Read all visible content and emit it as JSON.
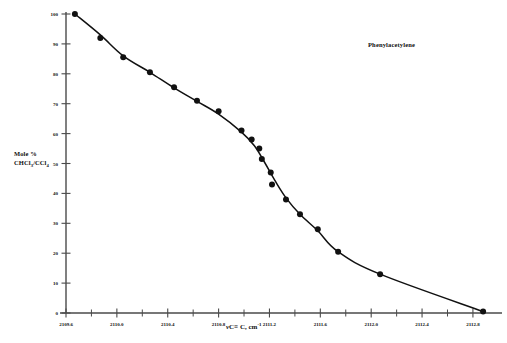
{
  "chart_data": {
    "type": "scatter",
    "title": "Phenylacetylene",
    "xlabel": "νC≡C, cm⁻¹",
    "ylabel": "Mole % CHCl3/CCl4",
    "ylabel_line1": "Mole %",
    "ylabel_line2_pre": "CHCl",
    "ylabel_line2_sub1": "3",
    "ylabel_line2_mid": "/CCl",
    "ylabel_line2_sub2": "4",
    "xlabel_nu": "ν",
    "xlabel_rest": "C≡ C, cm",
    "xlabel_sup": "-1",
    "xlim": [
      2109.6,
      2112.95
    ],
    "ylim": [
      0,
      100
    ],
    "grid": false,
    "legend": null,
    "x_tick_labels": [
      "2109.6",
      "2110.0",
      "2110.4",
      "2110.8",
      "2111.2",
      "2111.6",
      "2112.0",
      "2112.4",
      "2112.8"
    ],
    "x_tick_values": [
      2109.6,
      2110.0,
      2110.4,
      2110.8,
      2111.2,
      2111.6,
      2112.0,
      2112.4,
      2112.8
    ],
    "x_minor_tick_values": [
      2109.8,
      2110.2,
      2110.6,
      2111.0,
      2111.4,
      2111.8,
      2112.2,
      2112.6
    ],
    "y_tick_labels": [
      "0",
      "10",
      "20",
      "30",
      "40",
      "50",
      "60",
      "70",
      "80",
      "90",
      "100"
    ],
    "y_tick_values": [
      0,
      10,
      20,
      30,
      40,
      50,
      60,
      70,
      80,
      90,
      100
    ],
    "points": [
      {
        "x": 2109.67,
        "y": 100
      },
      {
        "x": 2109.87,
        "y": 92
      },
      {
        "x": 2110.05,
        "y": 85.5
      },
      {
        "x": 2110.26,
        "y": 80.5
      },
      {
        "x": 2110.45,
        "y": 75.5
      },
      {
        "x": 2110.63,
        "y": 71
      },
      {
        "x": 2110.8,
        "y": 67.5
      },
      {
        "x": 2110.98,
        "y": 61
      },
      {
        "x": 2111.06,
        "y": 58
      },
      {
        "x": 2111.12,
        "y": 55
      },
      {
        "x": 2111.14,
        "y": 51.5
      },
      {
        "x": 2111.21,
        "y": 47
      },
      {
        "x": 2111.22,
        "y": 43
      },
      {
        "x": 2111.33,
        "y": 38
      },
      {
        "x": 2111.44,
        "y": 33
      },
      {
        "x": 2111.58,
        "y": 28
      },
      {
        "x": 2111.74,
        "y": 20.5
      },
      {
        "x": 2112.07,
        "y": 13
      },
      {
        "x": 2112.88,
        "y": 0.5
      }
    ],
    "line_path": [
      {
        "x": 2109.67,
        "y": 100
      },
      {
        "x": 2109.87,
        "y": 93
      },
      {
        "x": 2110.05,
        "y": 86
      },
      {
        "x": 2110.26,
        "y": 80.5
      },
      {
        "x": 2110.45,
        "y": 75.3
      },
      {
        "x": 2110.63,
        "y": 70.8
      },
      {
        "x": 2110.8,
        "y": 66.5
      },
      {
        "x": 2110.98,
        "y": 60.5
      },
      {
        "x": 2111.08,
        "y": 56
      },
      {
        "x": 2111.16,
        "y": 50.5
      },
      {
        "x": 2111.24,
        "y": 44.5
      },
      {
        "x": 2111.33,
        "y": 38.5
      },
      {
        "x": 2111.44,
        "y": 33
      },
      {
        "x": 2111.58,
        "y": 27.5
      },
      {
        "x": 2111.74,
        "y": 20.5
      },
      {
        "x": 2112.07,
        "y": 13
      },
      {
        "x": 2112.88,
        "y": 0.5
      }
    ],
    "marker": "filled-circle",
    "marker_color": "#111111",
    "line_color": "#111111",
    "axis_color": "#4a4a4a"
  },
  "colors": {
    "background": "#ffffff",
    "ink": "#111111",
    "axis": "#4a4a4a"
  }
}
